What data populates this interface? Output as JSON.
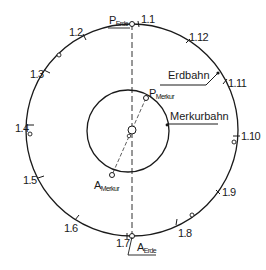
{
  "diagram": {
    "colors": {
      "stroke": "#1a1a1a",
      "background": "#ffffff"
    },
    "earth_orbit": {
      "label": "Erdbahn",
      "months": [
        {
          "label": "1.1"
        },
        {
          "label": "1.2"
        },
        {
          "label": "1.3"
        },
        {
          "label": "1.4"
        },
        {
          "label": "1.5"
        },
        {
          "label": "1.6"
        },
        {
          "label": "1.7"
        },
        {
          "label": "1.8"
        },
        {
          "label": "1.9"
        },
        {
          "label": "1.10"
        },
        {
          "label": "1.11"
        },
        {
          "label": "1.12"
        }
      ],
      "perihelion": {
        "main": "P",
        "sub": "Erde"
      },
      "aphelion": {
        "main": "A",
        "sub": "Erde"
      }
    },
    "mercury_orbit": {
      "label": "Merkurbahn",
      "perihelion": {
        "main": "P",
        "sub": "Merkur"
      },
      "aphelion": {
        "main": "A",
        "sub": "Merkur"
      }
    }
  }
}
